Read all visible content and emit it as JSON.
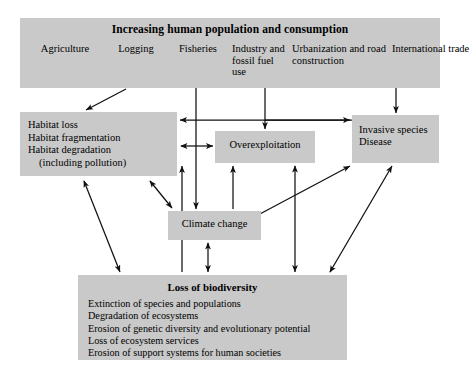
{
  "diagram": {
    "colors": {
      "box_fill": "#c9c9c9",
      "line": "#111111",
      "background": "#ffffff"
    },
    "banner": {
      "title": "Increasing human population and consumption",
      "drivers": [
        {
          "label": "Agriculture"
        },
        {
          "label": "Logging"
        },
        {
          "label": "Fisheries"
        },
        {
          "label": "Industry and fossil fuel use"
        },
        {
          "label": "Urbanization and road construction"
        },
        {
          "label": "International trade"
        }
      ]
    },
    "habitat": {
      "lines": [
        "Habitat loss",
        "Habitat fragmentation",
        "Habitat degradation",
        "(including pollution)"
      ]
    },
    "overexploitation": {
      "label": "Overexploitation"
    },
    "invasive": {
      "lines": [
        "Invasive species",
        "Disease"
      ]
    },
    "climate": {
      "label": "Climate change"
    },
    "loss": {
      "title": "Loss of biodiversity",
      "items": [
        "Extinction of species and populations",
        "Degradation of ecosystems",
        "Erosion of genetic diversity and evolutionary potential",
        "Loss of ecosystem services",
        "Erosion of support systems for human societies"
      ]
    }
  }
}
